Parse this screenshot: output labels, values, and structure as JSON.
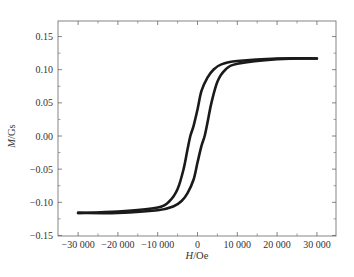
{
  "chart_data": {
    "type": "line",
    "title": "",
    "xlabel": "H/Oe",
    "xlabel_italic": "H",
    "xlabel_unit": "/Oe",
    "ylabel": "M/Gs",
    "ylabel_italic": "M",
    "ylabel_unit": "/Gs",
    "xlim": [
      -33500,
      35000
    ],
    "ylim": [
      -0.15,
      0.172
    ],
    "xticks": [
      -30000,
      -20000,
      -10000,
      0,
      10000,
      20000,
      30000
    ],
    "xtick_labels": [
      "−30 000",
      "−20 000",
      "−10 000",
      "0",
      "10 000",
      "20 000",
      "30 000"
    ],
    "yticks": [
      -0.15,
      -0.1,
      -0.05,
      0.0,
      0.05,
      0.1,
      0.15
    ],
    "ytick_labels": [
      "−0.15",
      "−0.10",
      "−0.05",
      "0.00",
      "0.05",
      "0.10",
      "0.15"
    ],
    "grid": false,
    "legend": null,
    "series": [
      {
        "name": "descending branch",
        "x": [
          30000,
          20000,
          10000,
          6000,
          4000,
          2500,
          1000,
          0,
          -1000,
          -1800,
          -2500,
          -3500,
          -5000,
          -7000,
          -10000,
          -20000,
          -30000
        ],
        "y": [
          0.117,
          0.117,
          0.113,
          0.108,
          0.1,
          0.088,
          0.068,
          0.04,
          0.015,
          0.0,
          -0.02,
          -0.05,
          -0.08,
          -0.098,
          -0.108,
          -0.114,
          -0.116
        ]
      },
      {
        "name": "ascending branch",
        "x": [
          -30000,
          -20000,
          -10000,
          -6000,
          -4000,
          -2500,
          -1000,
          0,
          1000,
          1800,
          2500,
          3500,
          5000,
          7000,
          10000,
          20000,
          30000
        ],
        "y": [
          -0.116,
          -0.116,
          -0.112,
          -0.106,
          -0.098,
          -0.086,
          -0.066,
          -0.04,
          -0.015,
          0.0,
          0.02,
          0.05,
          0.082,
          0.1,
          0.109,
          0.116,
          0.117
        ]
      }
    ],
    "color": "#1a1a1a"
  }
}
